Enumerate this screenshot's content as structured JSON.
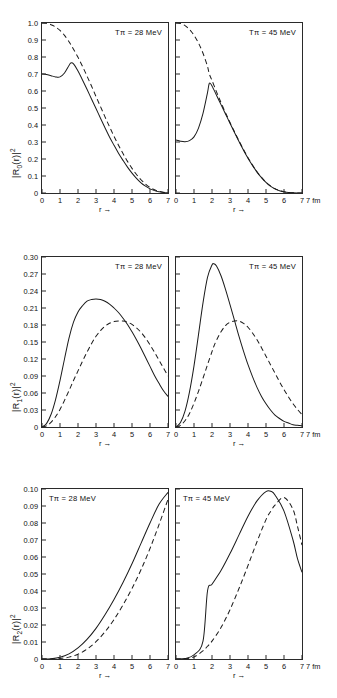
{
  "figure": {
    "axis_caption": "r →",
    "unit_label": "7 fm",
    "panels_per_row": 2
  },
  "rows": [
    {
      "ylabel": "|R₀(r)|²",
      "ylabel_base": "R",
      "ylabel_sub": "0",
      "yticks": [
        "1.0",
        "0.9",
        "0.8",
        "0.7",
        "0.6",
        "0.5",
        "0.4",
        "0.3",
        "0.2",
        "0.1",
        "0"
      ],
      "ytick_values": [
        1.0,
        0.9,
        0.8,
        0.7,
        0.6,
        0.5,
        0.4,
        0.3,
        0.2,
        0.1,
        0
      ],
      "ymin": 0,
      "ymax": 1.0,
      "xticks": [
        "0",
        "1",
        "2",
        "3",
        "4",
        "5",
        "6",
        "7"
      ],
      "left_annot": "Tπ = 28 MeV",
      "right_annot": "Tπ = 45 MeV"
    },
    {
      "ylabel": "|R₁(r)|²",
      "ylabel_base": "R",
      "ylabel_sub": "1",
      "yticks": [
        "0.30",
        "0.27",
        "0.24",
        "0.21",
        "0.18",
        "0.15",
        "0.12",
        "0.09",
        "0.06",
        "0.03",
        "0"
      ],
      "ytick_values": [
        0.3,
        0.27,
        0.24,
        0.21,
        0.18,
        0.15,
        0.12,
        0.09,
        0.06,
        0.03,
        0
      ],
      "ymin": 0,
      "ymax": 0.3,
      "xticks": [
        "0",
        "1",
        "2",
        "3",
        "4",
        "5",
        "6",
        "7"
      ],
      "left_annot": "Tπ = 28 MeV",
      "right_annot": "Tπ = 45 MeV"
    },
    {
      "ylabel": "|R₂(r)|²",
      "ylabel_base": "R",
      "ylabel_sub": "2",
      "yticks": [
        "0.10",
        "0.09",
        "0.08",
        "0.07",
        "0.06",
        "0.05",
        "0.04",
        "0.03",
        "0.02",
        "0.01",
        "0"
      ],
      "ytick_values": [
        0.1,
        0.09,
        0.08,
        0.07,
        0.06,
        0.05,
        0.04,
        0.03,
        0.02,
        0.01,
        0
      ],
      "ymin": 0,
      "ymax": 0.1,
      "xticks": [
        "0",
        "1",
        "2",
        "3",
        "4",
        "5",
        "6",
        "7"
      ],
      "left_annot": "Tπ = 28 MeV",
      "right_annot": "Tπ = 45 MeV"
    }
  ],
  "chart_data": [
    {
      "type": "line",
      "title": "|R0(r)|^2, T_pi = 28 MeV",
      "xlabel": "r",
      "ylabel": "|R0(r)|^2",
      "xlim": [
        0,
        7
      ],
      "ylim": [
        0,
        1.0
      ],
      "xunit": "fm",
      "grid": false,
      "legend": "none",
      "x": [
        0,
        0.25,
        0.5,
        0.75,
        1.0,
        1.25,
        1.5,
        1.6,
        1.75,
        2.0,
        2.25,
        2.5,
        2.75,
        3.0,
        3.25,
        3.5,
        3.75,
        4.0,
        4.25,
        4.5,
        4.75,
        5.0,
        5.25,
        5.5,
        5.75,
        6.0,
        6.25,
        6.5,
        6.75,
        7.0
      ],
      "series": [
        {
          "name": "solid",
          "style": "solid",
          "values": [
            0.7,
            0.697,
            0.69,
            0.683,
            0.683,
            0.706,
            0.75,
            0.765,
            0.76,
            0.718,
            0.665,
            0.61,
            0.553,
            0.497,
            0.44,
            0.384,
            0.33,
            0.281,
            0.234,
            0.192,
            0.152,
            0.117,
            0.086,
            0.06,
            0.04,
            0.024,
            0.014,
            0.007,
            0.003,
            0.001
          ]
        },
        {
          "name": "dashed",
          "style": "dashed",
          "values": [
            1.0,
            0.998,
            0.99,
            0.977,
            0.956,
            0.927,
            0.89,
            0.873,
            0.846,
            0.798,
            0.745,
            0.688,
            0.629,
            0.568,
            0.508,
            0.448,
            0.39,
            0.334,
            0.281,
            0.232,
            0.186,
            0.145,
            0.109,
            0.078,
            0.053,
            0.033,
            0.019,
            0.01,
            0.004,
            0.001
          ]
        }
      ]
    },
    {
      "type": "line",
      "title": "|R0(r)|^2, T_pi = 45 MeV",
      "xlabel": "r",
      "ylabel": "|R0(r)|^2",
      "xlim": [
        0,
        7
      ],
      "ylim": [
        0,
        1.0
      ],
      "xunit": "fm",
      "grid": false,
      "legend": "none",
      "x": [
        0,
        0.25,
        0.5,
        0.75,
        1.0,
        1.25,
        1.5,
        1.75,
        1.85,
        2.0,
        2.25,
        2.5,
        2.75,
        3.0,
        3.25,
        3.5,
        3.75,
        4.0,
        4.25,
        4.5,
        4.75,
        5.0,
        5.25,
        5.5,
        5.75,
        6.0,
        6.25,
        6.5,
        6.75,
        7.0
      ],
      "series": [
        {
          "name": "solid",
          "style": "solid",
          "values": [
            0.312,
            0.305,
            0.302,
            0.308,
            0.33,
            0.382,
            0.468,
            0.59,
            0.645,
            0.63,
            0.575,
            0.52,
            0.465,
            0.41,
            0.356,
            0.303,
            0.252,
            0.205,
            0.162,
            0.123,
            0.09,
            0.062,
            0.04,
            0.024,
            0.013,
            0.007,
            0.003,
            0.001,
            0.0,
            0.0
          ]
        },
        {
          "name": "dashed",
          "style": "dashed",
          "values": [
            1.0,
            0.997,
            0.985,
            0.962,
            0.928,
            0.882,
            0.822,
            0.745,
            0.7,
            0.662,
            0.595,
            0.532,
            0.472,
            0.415,
            0.36,
            0.307,
            0.256,
            0.208,
            0.164,
            0.125,
            0.092,
            0.063,
            0.041,
            0.025,
            0.014,
            0.007,
            0.003,
            0.001,
            0.0,
            0.0
          ]
        }
      ]
    },
    {
      "type": "line",
      "title": "|R1(r)|^2, T_pi = 28 MeV",
      "xlabel": "r",
      "ylabel": "|R1(r)|^2",
      "xlim": [
        0,
        7
      ],
      "ylim": [
        0,
        0.3
      ],
      "xunit": "fm",
      "grid": false,
      "legend": "none",
      "x": [
        0,
        0.25,
        0.5,
        0.75,
        1.0,
        1.25,
        1.5,
        1.75,
        2.0,
        2.25,
        2.5,
        2.75,
        3.0,
        3.25,
        3.5,
        3.75,
        4.0,
        4.25,
        4.5,
        4.75,
        5.0,
        5.25,
        5.5,
        5.75,
        6.0,
        6.25,
        6.5,
        6.75,
        7.0
      ],
      "series": [
        {
          "name": "solid",
          "style": "solid",
          "values": [
            0.0,
            0.006,
            0.022,
            0.048,
            0.082,
            0.12,
            0.157,
            0.185,
            0.203,
            0.214,
            0.222,
            0.225,
            0.226,
            0.225,
            0.222,
            0.217,
            0.21,
            0.202,
            0.192,
            0.181,
            0.168,
            0.154,
            0.139,
            0.123,
            0.107,
            0.091,
            0.077,
            0.064,
            0.054
          ]
        },
        {
          "name": "dashed",
          "style": "dashed",
          "values": [
            0.0,
            0.002,
            0.008,
            0.018,
            0.031,
            0.047,
            0.064,
            0.082,
            0.099,
            0.116,
            0.132,
            0.147,
            0.16,
            0.17,
            0.178,
            0.183,
            0.186,
            0.187,
            0.187,
            0.185,
            0.181,
            0.175,
            0.167,
            0.157,
            0.145,
            0.132,
            0.118,
            0.104,
            0.09
          ]
        }
      ]
    },
    {
      "type": "line",
      "title": "|R1(r)|^2, T_pi = 45 MeV",
      "xlabel": "r",
      "ylabel": "|R1(r)|^2",
      "xlim": [
        0,
        7
      ],
      "ylim": [
        0,
        0.3
      ],
      "xunit": "fm",
      "grid": false,
      "legend": "none",
      "x": [
        0,
        0.25,
        0.5,
        0.75,
        1.0,
        1.25,
        1.5,
        1.75,
        2.0,
        2.1,
        2.25,
        2.5,
        2.75,
        3.0,
        3.25,
        3.5,
        3.75,
        4.0,
        4.25,
        4.5,
        4.75,
        5.0,
        5.25,
        5.5,
        5.75,
        6.0,
        6.25,
        6.5,
        6.75,
        7.0
      ],
      "series": [
        {
          "name": "solid",
          "style": "solid",
          "values": [
            0.0,
            0.008,
            0.028,
            0.062,
            0.108,
            0.163,
            0.219,
            0.264,
            0.286,
            0.288,
            0.284,
            0.267,
            0.243,
            0.216,
            0.188,
            0.16,
            0.134,
            0.11,
            0.089,
            0.07,
            0.054,
            0.041,
            0.03,
            0.021,
            0.015,
            0.01,
            0.007,
            0.004,
            0.003,
            0.002
          ]
        },
        {
          "name": "dashed",
          "style": "dashed",
          "values": [
            0.0,
            0.003,
            0.011,
            0.024,
            0.042,
            0.063,
            0.086,
            0.11,
            0.133,
            0.142,
            0.153,
            0.168,
            0.179,
            0.185,
            0.187,
            0.187,
            0.183,
            0.176,
            0.166,
            0.154,
            0.14,
            0.125,
            0.11,
            0.095,
            0.08,
            0.066,
            0.053,
            0.041,
            0.031,
            0.022
          ]
        }
      ]
    },
    {
      "type": "line",
      "title": "|R2(r)|^2, T_pi = 28 MeV",
      "xlabel": "r",
      "ylabel": "|R2(r)|^2",
      "xlim": [
        0,
        7
      ],
      "ylim": [
        0,
        0.1
      ],
      "xunit": "fm",
      "grid": false,
      "legend": "none",
      "x": [
        0,
        0.5,
        1.0,
        1.5,
        2.0,
        2.5,
        3.0,
        3.5,
        4.0,
        4.5,
        5.0,
        5.5,
        6.0,
        6.5,
        7.0
      ],
      "series": [
        {
          "name": "solid",
          "style": "solid",
          "values": [
            0.0,
            0.0002,
            0.001,
            0.003,
            0.0065,
            0.0115,
            0.018,
            0.026,
            0.035,
            0.045,
            0.056,
            0.068,
            0.08,
            0.091,
            0.098
          ]
        },
        {
          "name": "dashed",
          "style": "dashed",
          "values": [
            0.0,
            0.0,
            0.0003,
            0.0011,
            0.0028,
            0.0058,
            0.0102,
            0.016,
            0.0232,
            0.0318,
            0.0415,
            0.0525,
            0.065,
            0.079,
            0.094
          ]
        }
      ]
    },
    {
      "type": "line",
      "title": "|R2(r)|^2, T_pi = 45 MeV",
      "xlabel": "r",
      "ylabel": "|R2(r)|^2",
      "xlim": [
        0,
        7
      ],
      "ylim": [
        0,
        0.1
      ],
      "xunit": "fm",
      "grid": false,
      "legend": "none",
      "x": [
        0,
        0.5,
        1.0,
        1.5,
        1.75,
        2.0,
        2.5,
        3.0,
        3.5,
        4.0,
        4.5,
        5.0,
        5.3,
        5.5,
        6.0,
        6.5,
        6.75,
        7.0
      ],
      "series": [
        {
          "name": "solid",
          "style": "solid",
          "values": [
            0.0,
            0.0003,
            0.0025,
            0.0105,
            0.04,
            0.044,
            0.052,
            0.062,
            0.073,
            0.084,
            0.093,
            0.0985,
            0.0985,
            0.0965,
            0.087,
            0.07,
            0.059,
            0.051
          ]
        },
        {
          "name": "dashed",
          "style": "dashed",
          "values": [
            0.0,
            0.0001,
            0.0012,
            0.0048,
            0.0075,
            0.0105,
            0.0185,
            0.029,
            0.0415,
            0.055,
            0.069,
            0.082,
            0.0875,
            0.0905,
            0.095,
            0.088,
            0.078,
            0.067
          ]
        }
      ]
    }
  ]
}
